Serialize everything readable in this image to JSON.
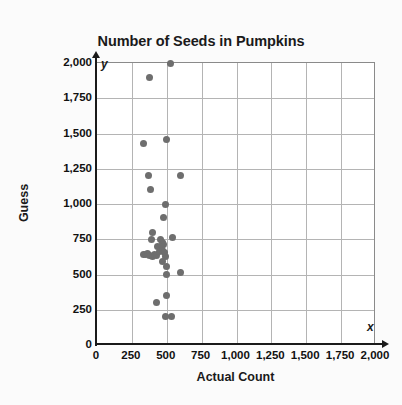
{
  "chart_data": {
    "type": "scatter",
    "title": "Number of Seeds in Pumpkins",
    "xlabel": "Actual Count",
    "ylabel": "Guess",
    "x_axis_letter": "x",
    "y_axis_letter": "y",
    "xlim": [
      0,
      2000
    ],
    "ylim": [
      0,
      2000
    ],
    "grid": true,
    "legend": null,
    "marker_color": "#6e6e6e",
    "grid_color": "#b4b4b4",
    "axis_color": "#1a1a1a",
    "xticks": [
      0,
      250,
      500,
      750,
      1000,
      1250,
      1500,
      1750,
      2000
    ],
    "yticks": [
      0,
      250,
      500,
      750,
      1000,
      1250,
      1500,
      1750,
      2000
    ],
    "xtick_labels": [
      "0",
      "250",
      "500",
      "750",
      "1,000",
      "1,250",
      "1,500",
      "1,750",
      "2,000"
    ],
    "ytick_labels": [
      "0",
      "250",
      "500",
      "750",
      "1,000",
      "1,250",
      "1,500",
      "1,750",
      "2,000"
    ],
    "points": [
      {
        "x": 530,
        "y": 2000
      },
      {
        "x": 375,
        "y": 1900
      },
      {
        "x": 330,
        "y": 1430
      },
      {
        "x": 495,
        "y": 1460
      },
      {
        "x": 370,
        "y": 1205
      },
      {
        "x": 600,
        "y": 1205
      },
      {
        "x": 385,
        "y": 1105
      },
      {
        "x": 490,
        "y": 1000
      },
      {
        "x": 475,
        "y": 905
      },
      {
        "x": 395,
        "y": 800
      },
      {
        "x": 540,
        "y": 765
      },
      {
        "x": 390,
        "y": 745
      },
      {
        "x": 455,
        "y": 745
      },
      {
        "x": 470,
        "y": 730
      },
      {
        "x": 480,
        "y": 715
      },
      {
        "x": 435,
        "y": 700
      },
      {
        "x": 465,
        "y": 700
      },
      {
        "x": 330,
        "y": 640
      },
      {
        "x": 345,
        "y": 640
      },
      {
        "x": 360,
        "y": 650
      },
      {
        "x": 375,
        "y": 635
      },
      {
        "x": 400,
        "y": 625
      },
      {
        "x": 415,
        "y": 640
      },
      {
        "x": 430,
        "y": 635
      },
      {
        "x": 450,
        "y": 660
      },
      {
        "x": 470,
        "y": 670
      },
      {
        "x": 485,
        "y": 655
      },
      {
        "x": 490,
        "y": 630
      },
      {
        "x": 470,
        "y": 590
      },
      {
        "x": 495,
        "y": 560
      },
      {
        "x": 495,
        "y": 500
      },
      {
        "x": 600,
        "y": 515
      },
      {
        "x": 500,
        "y": 350
      },
      {
        "x": 425,
        "y": 300
      },
      {
        "x": 490,
        "y": 205
      },
      {
        "x": 535,
        "y": 205
      }
    ]
  }
}
